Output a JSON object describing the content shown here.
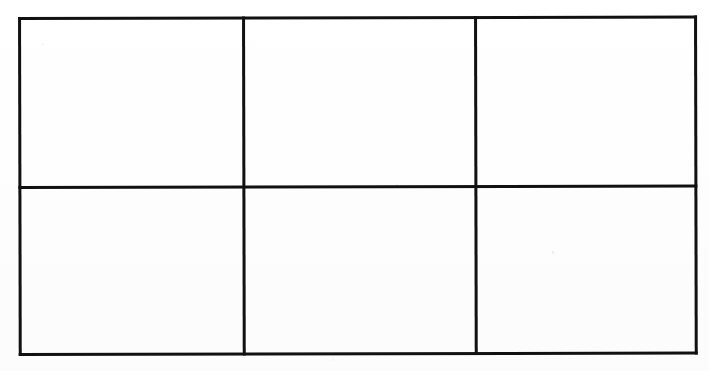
{
  "document": {
    "type": "scanned-empty-table",
    "background_color": "#fefefe",
    "line_color": "#111111"
  },
  "table": {
    "name": "empty-grid-table",
    "columns": 3,
    "rows": 2,
    "bounds": {
      "left": 18,
      "top": 17,
      "right": 697,
      "bottom": 356
    },
    "column_dividers_x": [
      242,
      474
    ],
    "row_dividers_y": [
      186
    ],
    "border_width_px": 3,
    "cells": [
      {
        "row": 0,
        "col": 0,
        "text": ""
      },
      {
        "row": 0,
        "col": 1,
        "text": ""
      },
      {
        "row": 0,
        "col": 2,
        "text": ""
      },
      {
        "row": 1,
        "col": 0,
        "text": ""
      },
      {
        "row": 1,
        "col": 1,
        "text": ""
      },
      {
        "row": 1,
        "col": 2,
        "text": ""
      }
    ]
  }
}
